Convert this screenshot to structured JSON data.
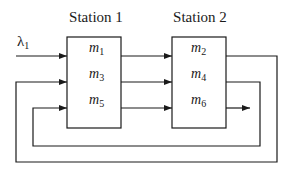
{
  "diagram": {
    "stations": [
      {
        "label": "Station 1",
        "machines": [
          {
            "base": "m",
            "sub": "1"
          },
          {
            "base": "m",
            "sub": "3"
          },
          {
            "base": "m",
            "sub": "5"
          }
        ]
      },
      {
        "label": "Station 2",
        "machines": [
          {
            "base": "m",
            "sub": "2"
          },
          {
            "base": "m",
            "sub": "4"
          },
          {
            "base": "m",
            "sub": "6"
          }
        ]
      }
    ],
    "input": {
      "base": "λ",
      "sub": "1"
    },
    "flow": [
      "λ1 → m1 → m2 → m3 → m4 → m5 → m6 → exit"
    ],
    "line_color": "#1a1a1a"
  }
}
